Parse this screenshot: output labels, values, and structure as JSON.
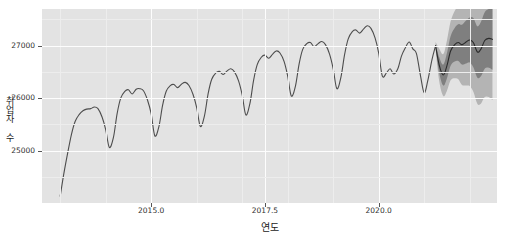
{
  "chart_data": {
    "type": "line",
    "title": "",
    "xlabel": "연도",
    "ylabel": "취업자 수",
    "xlim": [
      2012.6,
      2022.6
    ],
    "ylim": [
      24000,
      27700
    ],
    "xticks": [
      2015.0,
      2017.5,
      2020.0
    ],
    "xtick_labels": [
      "2015.0",
      "2017.5",
      "2020.0"
    ],
    "yticks": [
      25000,
      26000,
      27000
    ],
    "ytick_labels": [
      "25000",
      "26000",
      "27000"
    ],
    "grid": true,
    "legend": "none",
    "series": [
      {
        "name": "취업자 수",
        "kind": "observed-line",
        "color": "#4d4d4d",
        "x": [
          2013.0,
          2013.08,
          2013.17,
          2013.25,
          2013.33,
          2013.42,
          2013.5,
          2013.58,
          2013.67,
          2013.75,
          2013.83,
          2013.92,
          2014.0,
          2014.08,
          2014.17,
          2014.25,
          2014.33,
          2014.42,
          2014.5,
          2014.58,
          2014.67,
          2014.75,
          2014.83,
          2014.92,
          2015.0,
          2015.08,
          2015.17,
          2015.25,
          2015.33,
          2015.42,
          2015.5,
          2015.58,
          2015.67,
          2015.75,
          2015.83,
          2015.92,
          2016.0,
          2016.08,
          2016.17,
          2016.25,
          2016.33,
          2016.42,
          2016.5,
          2016.58,
          2016.67,
          2016.75,
          2016.83,
          2016.92,
          2017.0,
          2017.08,
          2017.17,
          2017.25,
          2017.33,
          2017.42,
          2017.5,
          2017.58,
          2017.67,
          2017.75,
          2017.83,
          2017.92,
          2018.0,
          2018.08,
          2018.17,
          2018.25,
          2018.33,
          2018.42,
          2018.5,
          2018.58,
          2018.67,
          2018.75,
          2018.83,
          2018.92,
          2019.0,
          2019.08,
          2019.17,
          2019.25,
          2019.33,
          2019.42,
          2019.5,
          2019.58,
          2019.67,
          2019.75,
          2019.83,
          2019.92,
          2020.0,
          2020.08,
          2020.17,
          2020.25,
          2020.33,
          2020.42,
          2020.5,
          2020.58,
          2020.67,
          2020.75,
          2020.83,
          2020.92,
          2021.0,
          2021.08,
          2021.17,
          2021.25
        ],
        "y": [
          24130,
          24560,
          24980,
          25320,
          25560,
          25690,
          25760,
          25790,
          25800,
          25830,
          25800,
          25640,
          25400,
          25060,
          25250,
          25700,
          26000,
          26130,
          26160,
          26080,
          26170,
          26180,
          26140,
          25960,
          25700,
          25280,
          25460,
          25860,
          26130,
          26240,
          26260,
          26200,
          26270,
          26300,
          26240,
          26070,
          25820,
          25460,
          25660,
          26080,
          26360,
          26480,
          26510,
          26450,
          26520,
          26560,
          26500,
          26330,
          26060,
          25680,
          25900,
          26340,
          26640,
          26780,
          26820,
          26760,
          26840,
          26900,
          26860,
          26700,
          26420,
          26040,
          26230,
          26650,
          26930,
          27040,
          27060,
          26980,
          27040,
          27080,
          27020,
          26840,
          26560,
          26180,
          26400,
          26830,
          27130,
          27270,
          27300,
          27240,
          27320,
          27380,
          27330,
          27150,
          26860,
          26420,
          26480,
          26560,
          26460,
          26560,
          26800,
          26950,
          27070,
          26940,
          26850,
          26420,
          26100,
          26340,
          26730,
          27000
        ]
      },
      {
        "name": "예측값",
        "kind": "forecast-line",
        "color": "#2b2b2b",
        "x": [
          2021.25,
          2021.33,
          2021.42,
          2021.5,
          2021.58,
          2021.67,
          2021.75,
          2021.83,
          2021.92,
          2022.0,
          2022.08,
          2022.17,
          2022.25,
          2022.33,
          2022.42,
          2022.5
        ],
        "y": [
          27000,
          26630,
          26440,
          26620,
          26900,
          27020,
          27060,
          27020,
          27070,
          27110,
          27060,
          26880,
          26940,
          27100,
          27140,
          27120
        ]
      }
    ],
    "bands": [
      {
        "name": "outer-confidence-interval",
        "color": "#b4b4b4",
        "x": [
          2021.25,
          2021.33,
          2021.42,
          2021.5,
          2021.58,
          2021.67,
          2021.75,
          2021.83,
          2021.92,
          2022.0,
          2022.08,
          2022.17,
          2022.25,
          2022.33,
          2022.42,
          2022.5
        ],
        "lower": [
          26930,
          26320,
          26040,
          26140,
          26340,
          26380,
          26360,
          26250,
          26240,
          26230,
          26120,
          25890,
          25900,
          26020,
          26020,
          25960
        ],
        "upper": [
          27070,
          26940,
          26840,
          27100,
          27460,
          27660,
          27760,
          27790,
          27900,
          27990,
          28000,
          27870,
          27980,
          28180,
          28260,
          28280
        ]
      },
      {
        "name": "inner-confidence-interval",
        "color": "#7f7f7f",
        "x": [
          2021.25,
          2021.33,
          2021.42,
          2021.5,
          2021.58,
          2021.67,
          2021.75,
          2021.83,
          2021.92,
          2022.0,
          2022.08,
          2022.17,
          2022.25,
          2022.33,
          2022.42,
          2022.5
        ],
        "lower": [
          26970,
          26480,
          26240,
          26380,
          26620,
          26700,
          26710,
          26640,
          26660,
          26680,
          26590,
          26390,
          26420,
          26560,
          26580,
          26540
        ],
        "upper": [
          27030,
          26780,
          26640,
          26860,
          27180,
          27340,
          27410,
          27400,
          27480,
          27540,
          27530,
          27370,
          27460,
          27640,
          27700,
          27700
        ]
      }
    ]
  }
}
